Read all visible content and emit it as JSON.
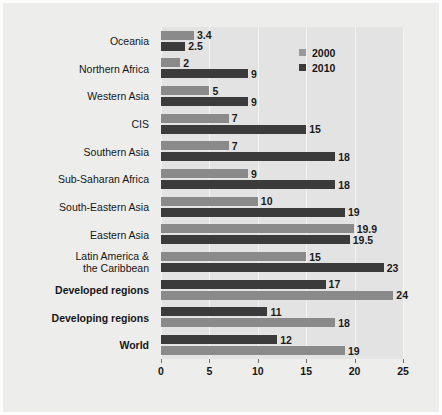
{
  "chart_data": {
    "type": "bar",
    "orientation": "horizontal",
    "title": "",
    "xlabel": "",
    "ylabel": "",
    "xlim": [
      0,
      25
    ],
    "xticks": [
      0,
      5,
      10,
      15,
      20,
      25
    ],
    "xticklabels": [
      "0",
      "5",
      "10",
      "15",
      "20",
      "25"
    ],
    "grid": "vertical",
    "legend_position": "top-right",
    "categories": [
      "Oceania",
      "Northern Africa",
      "Western Asia",
      "CIS",
      "Southern Asia",
      "Sub-Saharan Africa",
      "South-Eastern Asia",
      "Eastern Asia",
      "Latin America & the Caribbean",
      "Developed regions",
      "Developing regions",
      "World"
    ],
    "series": [
      {
        "name": "2000",
        "color": "#8a8a8a",
        "values": [
          3.4,
          2,
          5,
          7,
          7,
          9,
          10,
          19.9,
          15,
          24,
          18,
          19
        ],
        "labels": [
          "3.4",
          "2",
          "5",
          "7",
          "7",
          "9",
          "10",
          "19.9",
          "15",
          "24",
          "18",
          "19"
        ]
      },
      {
        "name": "2010",
        "color": "#3b3b3b",
        "values": [
          2.5,
          9,
          9,
          15,
          18,
          18,
          19,
          19.5,
          23,
          17,
          11,
          12
        ],
        "labels": [
          "2.5",
          "9",
          "9",
          "15",
          "18",
          "18",
          "19",
          "19.5",
          "23",
          "17",
          "11",
          "12"
        ]
      }
    ]
  },
  "rows": [
    {
      "category": "Oceania",
      "bold": false,
      "order": [
        "2000",
        "2010"
      ],
      "bars": [
        {
          "series": "2000",
          "value": 3.4,
          "label": "3.4"
        },
        {
          "series": "2010",
          "value": 2.5,
          "label": "2.5"
        }
      ]
    },
    {
      "category": "Northern Africa",
      "bold": false,
      "order": [
        "2000",
        "2010"
      ],
      "bars": [
        {
          "series": "2000",
          "value": 2,
          "label": "2"
        },
        {
          "series": "2010",
          "value": 9,
          "label": "9"
        }
      ]
    },
    {
      "category": "Western Asia",
      "bold": false,
      "order": [
        "2000",
        "2010"
      ],
      "bars": [
        {
          "series": "2000",
          "value": 5,
          "label": "5"
        },
        {
          "series": "2010",
          "value": 9,
          "label": "9"
        }
      ]
    },
    {
      "category": "CIS",
      "bold": false,
      "order": [
        "2000",
        "2010"
      ],
      "bars": [
        {
          "series": "2000",
          "value": 7,
          "label": "7"
        },
        {
          "series": "2010",
          "value": 15,
          "label": "15"
        }
      ]
    },
    {
      "category": "Southern Asia",
      "bold": false,
      "order": [
        "2000",
        "2010"
      ],
      "bars": [
        {
          "series": "2000",
          "value": 7,
          "label": "7"
        },
        {
          "series": "2010",
          "value": 18,
          "label": "18"
        }
      ]
    },
    {
      "category": "Sub-Saharan Africa",
      "bold": false,
      "order": [
        "2000",
        "2010"
      ],
      "bars": [
        {
          "series": "2000",
          "value": 9,
          "label": "9"
        },
        {
          "series": "2010",
          "value": 18,
          "label": "18"
        }
      ]
    },
    {
      "category": "South-Eastern Asia",
      "bold": false,
      "order": [
        "2000",
        "2010"
      ],
      "bars": [
        {
          "series": "2000",
          "value": 10,
          "label": "10"
        },
        {
          "series": "2010",
          "value": 19,
          "label": "19"
        }
      ]
    },
    {
      "category": "Eastern Asia",
      "bold": false,
      "order": [
        "2000",
        "2010"
      ],
      "bars": [
        {
          "series": "2000",
          "value": 19.9,
          "label": "19.9"
        },
        {
          "series": "2010",
          "value": 19.5,
          "label": "19.5"
        }
      ]
    },
    {
      "category": "Latin America &\nthe Caribbean",
      "bold": false,
      "order": [
        "2000",
        "2010"
      ],
      "bars": [
        {
          "series": "2000",
          "value": 15,
          "label": "15"
        },
        {
          "series": "2010",
          "value": 23,
          "label": "23"
        }
      ]
    },
    {
      "category": "Developed regions",
      "bold": true,
      "order": [
        "2010",
        "2000"
      ],
      "bars": [
        {
          "series": "2010",
          "value": 17,
          "label": "17"
        },
        {
          "series": "2000",
          "value": 24,
          "label": "24"
        }
      ]
    },
    {
      "category": "Developing regions",
      "bold": true,
      "order": [
        "2010",
        "2000"
      ],
      "bars": [
        {
          "series": "2010",
          "value": 11,
          "label": "11"
        },
        {
          "series": "2000",
          "value": 18,
          "label": "18"
        }
      ]
    },
    {
      "category": "World",
      "bold": true,
      "order": [
        "2010",
        "2000"
      ],
      "bars": [
        {
          "series": "2010",
          "value": 12,
          "label": "12"
        },
        {
          "series": "2000",
          "value": 19,
          "label": "19"
        }
      ]
    }
  ],
  "legend": {
    "items": [
      {
        "label": "2000",
        "series": "2000",
        "color": "#8a8a8a"
      },
      {
        "label": "2010",
        "series": "2010",
        "color": "#3b3b3b"
      }
    ]
  },
  "axis": {
    "ticklabels": [
      "0",
      "5",
      "10",
      "15",
      "20",
      "25"
    ]
  },
  "colors": {
    "series_2000": "#8a8a8a",
    "series_2010": "#3b3b3b",
    "plot_background": "#e4e3e3",
    "figure_background": "#ededec",
    "gridline": "#f4f4f4"
  }
}
